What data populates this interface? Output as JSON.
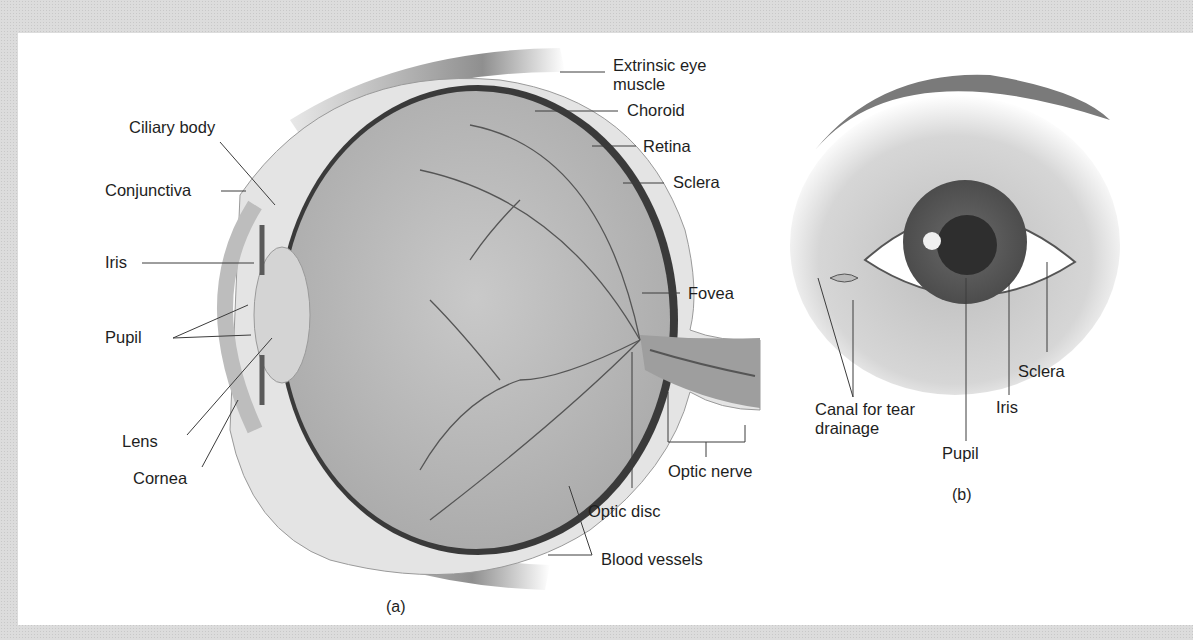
{
  "figure": {
    "panel_a": {
      "caption": "(a)",
      "labels": {
        "extrinsic_muscle_line1": "Extrinsic eye",
        "extrinsic_muscle_line2": "muscle",
        "choroid": "Choroid",
        "retina": "Retina",
        "sclera": "Sclera",
        "ciliary_body": "Ciliary body",
        "conjunctiva": "Conjunctiva",
        "iris": "Iris",
        "pupil": "Pupil",
        "lens": "Lens",
        "cornea": "Cornea",
        "fovea": "Fovea",
        "optic_nerve": "Optic nerve",
        "optic_disc": "Optic disc",
        "blood_vessels": "Blood vessels"
      }
    },
    "panel_b": {
      "caption": "(b)",
      "labels": {
        "canal_line1": "Canal for tear",
        "canal_line2": "drainage",
        "pupil": "Pupil",
        "iris": "Iris",
        "sclera": "Sclera"
      }
    }
  }
}
